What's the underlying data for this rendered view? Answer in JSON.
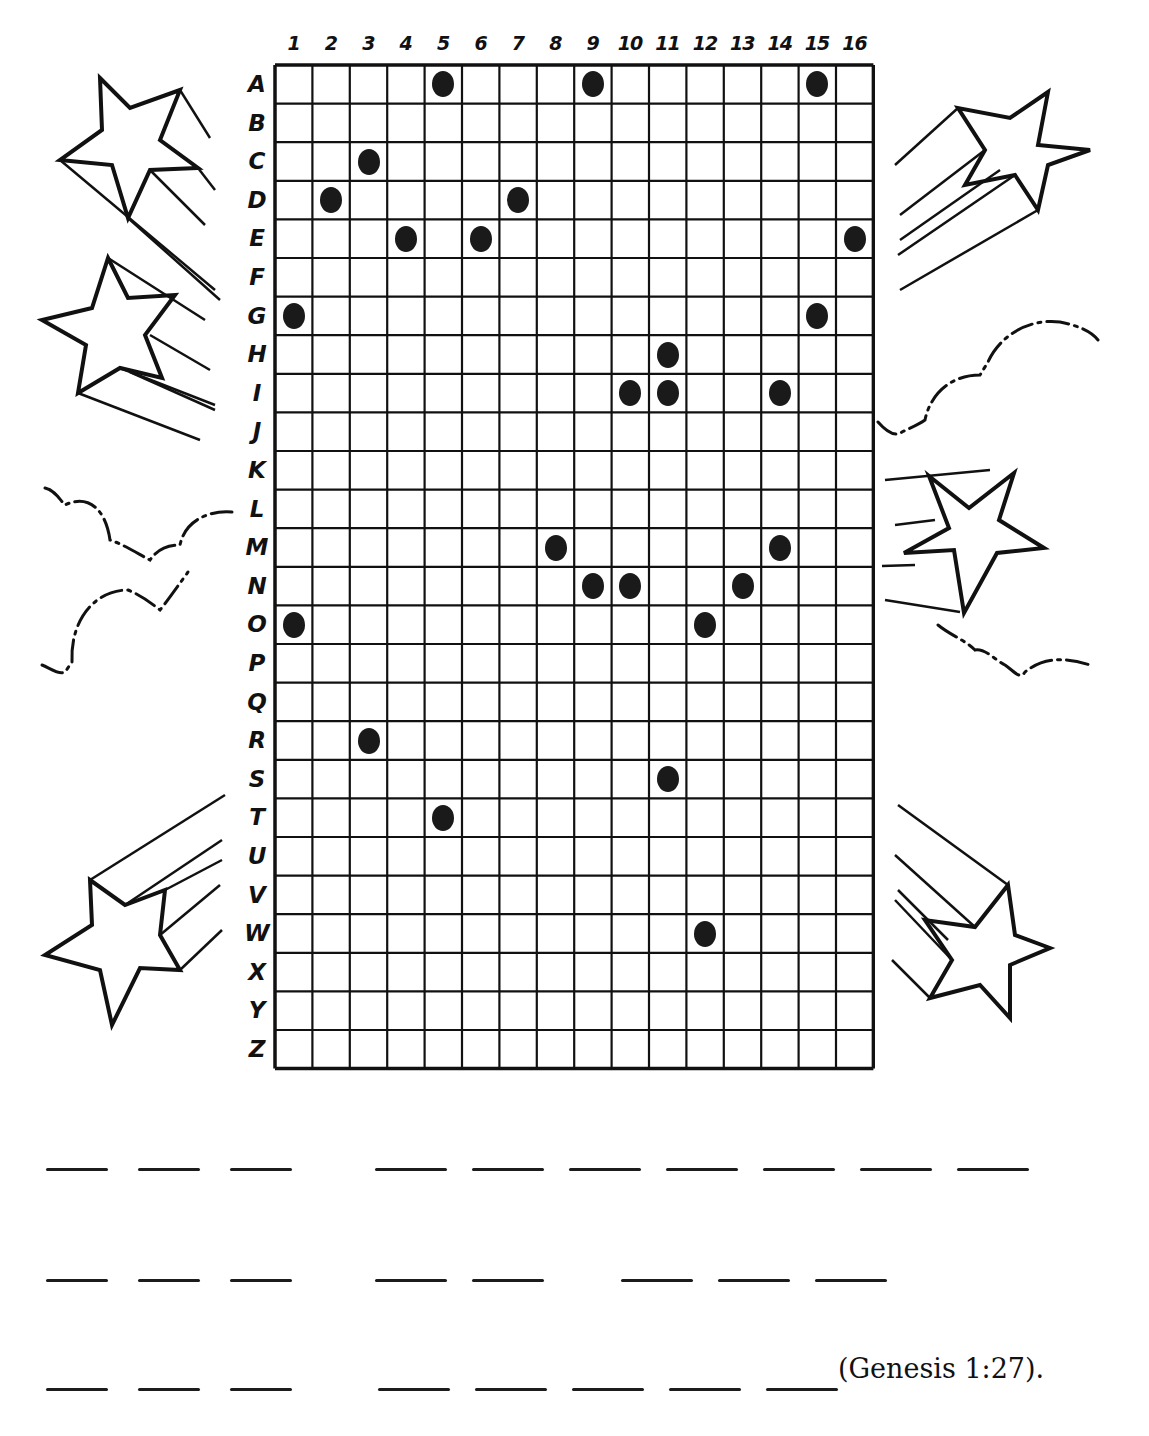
{
  "puzzle": {
    "columns": [
      "1",
      "2",
      "3",
      "4",
      "5",
      "6",
      "7",
      "8",
      "9",
      "10",
      "11",
      "12",
      "13",
      "14",
      "15",
      "16"
    ],
    "rows": [
      "A",
      "B",
      "C",
      "D",
      "E",
      "F",
      "G",
      "H",
      "I",
      "J",
      "K",
      "L",
      "M",
      "N",
      "O",
      "P",
      "Q",
      "R",
      "S",
      "T",
      "U",
      "V",
      "W",
      "X",
      "Y",
      "Z"
    ],
    "dots": [
      {
        "row": "A",
        "col": 5
      },
      {
        "row": "A",
        "col": 9
      },
      {
        "row": "A",
        "col": 15
      },
      {
        "row": "C",
        "col": 3
      },
      {
        "row": "D",
        "col": 2
      },
      {
        "row": "D",
        "col": 7
      },
      {
        "row": "E",
        "col": 4
      },
      {
        "row": "E",
        "col": 6
      },
      {
        "row": "E",
        "col": 16
      },
      {
        "row": "G",
        "col": 1
      },
      {
        "row": "G",
        "col": 15
      },
      {
        "row": "H",
        "col": 11
      },
      {
        "row": "I",
        "col": 10
      },
      {
        "row": "I",
        "col": 11
      },
      {
        "row": "I",
        "col": 14
      },
      {
        "row": "M",
        "col": 8
      },
      {
        "row": "M",
        "col": 14
      },
      {
        "row": "N",
        "col": 9
      },
      {
        "row": "N",
        "col": 10
      },
      {
        "row": "N",
        "col": 13
      },
      {
        "row": "O",
        "col": 1
      },
      {
        "row": "O",
        "col": 12
      },
      {
        "row": "R",
        "col": 3
      },
      {
        "row": "S",
        "col": 11
      },
      {
        "row": "T",
        "col": 5
      },
      {
        "row": "W",
        "col": 12
      }
    ]
  },
  "answer_lines": [
    {
      "words": [
        3,
        7
      ]
    },
    {
      "words": [
        3,
        2,
        3
      ]
    },
    {
      "words": [
        3,
        5
      ]
    }
  ],
  "reference": "(Genesis 1:27).",
  "colors": {
    "ink": "#111111",
    "paper": "#ffffff"
  }
}
